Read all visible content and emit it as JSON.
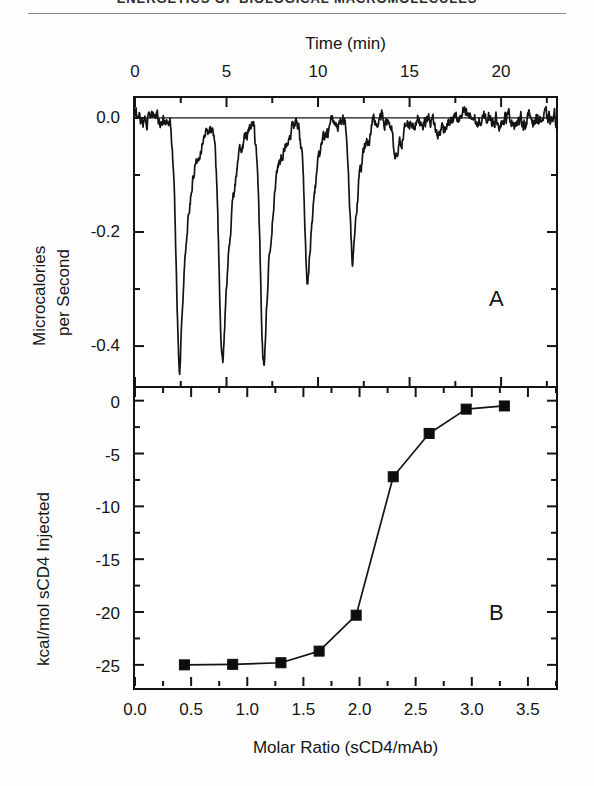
{
  "page": {
    "running_head": "ENERGETICS OF BIOLOGICAL MACROMOLECULES",
    "background_color": "#fefefe",
    "ink_color": "#141414"
  },
  "panel_a_label": "A",
  "panel_b_label": "B",
  "chart_data": [
    {
      "id": "panel-a",
      "panel": "A",
      "type": "line",
      "title": "",
      "xlabel": "Time (min)",
      "ylabel": "Microcalories per Second",
      "xlabel_position": "top",
      "xlim": [
        0,
        23
      ],
      "ylim": [
        -0.47,
        0.035
      ],
      "xticks": [
        0,
        5,
        10,
        15,
        20
      ],
      "xticklabels": [
        "0",
        "5",
        "10",
        "15",
        "20"
      ],
      "xminorticks": [
        2.5,
        7.5,
        12.5,
        17.5,
        22.5
      ],
      "yticks": [
        0.0,
        -0.2,
        -0.4
      ],
      "yticklabels": [
        "0.0",
        "-0.2",
        "-0.4"
      ],
      "yminorticks": [
        -0.1,
        -0.3
      ],
      "grid": false,
      "legend": false,
      "description": "Isothermal titration calorimetry raw thermogram: ten injection peaks of decreasing exothermic magnitude on a flat baseline near 0.0.",
      "baseline": 0.0,
      "peaks": [
        {
          "index": 1,
          "time_min": 2.45,
          "depth_ucal_per_s": -0.432,
          "width_min": 0.95
        },
        {
          "index": 2,
          "time_min": 4.8,
          "depth_ucal_per_s": -0.438,
          "width_min": 0.95
        },
        {
          "index": 3,
          "time_min": 7.05,
          "depth_ucal_per_s": -0.43,
          "width_min": 0.95
        },
        {
          "index": 4,
          "time_min": 9.45,
          "depth_ucal_per_s": -0.293,
          "width_min": 0.85
        },
        {
          "index": 5,
          "time_min": 11.9,
          "depth_ucal_per_s": -0.247,
          "width_min": 0.8
        },
        {
          "index": 6,
          "time_min": 14.25,
          "depth_ucal_per_s": -0.083,
          "width_min": 0.7
        },
        {
          "index": 7,
          "time_min": 16.55,
          "depth_ucal_per_s": -0.034,
          "width_min": 0.62
        },
        {
          "index": 8,
          "time_min": 18.8,
          "depth_ucal_per_s": -0.013,
          "width_min": 0.55
        },
        {
          "index": 9,
          "time_min": 21.0,
          "depth_ucal_per_s": -0.01,
          "width_min": 0.55
        },
        {
          "index": 10,
          "time_min": 22.6,
          "depth_ucal_per_s": -0.008,
          "width_min": 0.5
        }
      ],
      "baseline_noise_amplitude_ucal_per_s": 0.012
    },
    {
      "id": "panel-b",
      "panel": "B",
      "type": "line",
      "title": "",
      "xlabel": "Molar Ratio (sCD4/mAb)",
      "ylabel": "kcal/mol sCD4 Injected",
      "xlabel_position": "bottom",
      "xlim": [
        0.0,
        3.75
      ],
      "ylim": [
        -27.0,
        1.2
      ],
      "xticks": [
        0.0,
        0.5,
        1.0,
        1.5,
        2.0,
        2.5,
        3.0,
        3.5
      ],
      "xticklabels": [
        "0.0",
        "0.5",
        "1.0",
        "1.5",
        "2.0",
        "2.5",
        "3.0",
        "3.5"
      ],
      "xminorticks": [
        0.25,
        0.75,
        1.25,
        1.75,
        2.25,
        2.75,
        3.25,
        3.75
      ],
      "yticks": [
        0,
        -5,
        -10,
        -15,
        -20,
        -25
      ],
      "yticklabels": [
        "0",
        "-5",
        "-10",
        "-15",
        "-20",
        "-25"
      ],
      "yminorticks": [
        -2.5,
        -7.5,
        -12.5,
        -17.5,
        -22.5
      ],
      "grid": false,
      "legend": false,
      "marker": "filled-square",
      "description": "Integrated binding isotherm: heat per mole of sCD4 injected versus molar ratio, sigmoidal transition near a molar ratio of 2.2.",
      "x": [
        0.44,
        0.87,
        1.3,
        1.64,
        1.97,
        2.3,
        2.62,
        2.95,
        3.29
      ],
      "values": [
        -25.0,
        -24.95,
        -24.8,
        -23.7,
        -20.3,
        -7.2,
        -3.1,
        -0.8,
        -0.5
      ]
    }
  ]
}
